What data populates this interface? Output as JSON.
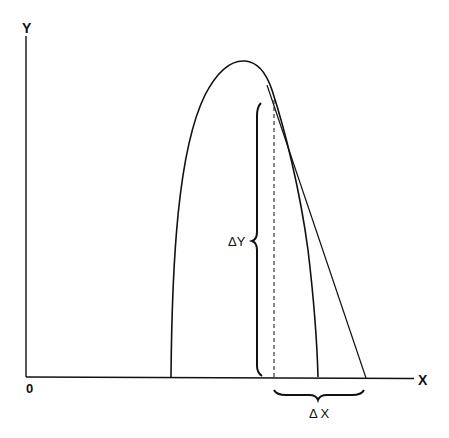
{
  "diagram": {
    "type": "curve-with-tangent",
    "axes": {
      "y_label": "Y",
      "x_label": "X",
      "origin_label": "0"
    },
    "annotations": {
      "delta_y": "ΔY",
      "delta_x": "Δ X"
    },
    "colors": {
      "stroke": "#111111",
      "background": "#ffffff"
    }
  }
}
